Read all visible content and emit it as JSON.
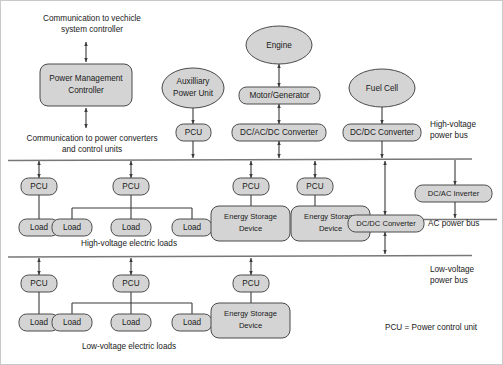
{
  "diagram": {
    "colors": {
      "node_fill": "#d4d4d4",
      "node_stroke": "#4a4a4a",
      "bus_line": "#777777",
      "connector": "#3a3a3a",
      "background": "#ffffff",
      "text": "#1a1a1a"
    },
    "annotations": {
      "comm_top": "Communication to vechicle\nsystem controller",
      "comm_top_line1": "Communication to vechicle",
      "comm_top_line2": "system controller",
      "comm_bottom_line1": "Communication to power converters",
      "comm_bottom_line2": "and control units",
      "hv_bus_line1": "High-voltage",
      "hv_bus_line2": "power bus",
      "lv_bus_line1": "Low-voltage",
      "lv_bus_line2": "power bus",
      "ac_bus": "AC power bus",
      "hv_loads": "High-voltage electric loads",
      "lv_loads": "Low-voltage electric loads",
      "legend": "PCU = Power control unit"
    },
    "sources": {
      "power_management_controller": "Power Management\nController",
      "pmc_line1": "Power Management",
      "pmc_line2": "Controller",
      "auxiliary_power_unit_line1": "Auxilliary",
      "auxiliary_power_unit_line2": "Power Unit",
      "engine": "Engine",
      "motor_generator": "Motor/Generator",
      "fuel_cell": "Fuel Cell",
      "apu_pcu": "PCU",
      "dc_ac_dc_converter": "DC/AC/DC Converter",
      "fuel_cell_dc_dc_converter": "DC/DC Converter"
    },
    "hv_band": {
      "pcus": [
        "PCU",
        "PCU",
        "PCU",
        "PCU"
      ],
      "loads_group_a": [
        "Load"
      ],
      "loads_group_b": [
        "Load",
        "Load",
        "Load"
      ],
      "energy_storage_line1": "Energy Storage",
      "energy_storage_line2": "Device",
      "energy_storage_devices": [
        "Energy Storage Device",
        "Energy Storage Device"
      ],
      "bus_dc_dc_converter": "DC/DC Converter",
      "dc_ac_inverter": "DC/AC Inverter"
    },
    "lv_band": {
      "pcus": [
        "PCU",
        "PCU",
        "PCU"
      ],
      "loads_group_a": [
        "Load"
      ],
      "loads_group_b": [
        "Load",
        "Load",
        "Load"
      ],
      "energy_storage_line1": "Energy Storage",
      "energy_storage_line2": "Device"
    }
  }
}
